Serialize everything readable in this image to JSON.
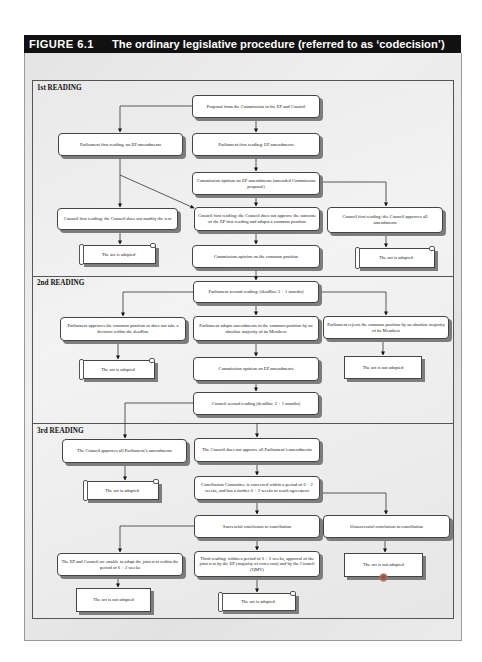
{
  "figure": {
    "number": "FIGURE 6.1",
    "title": "The ordinary legislative procedure (referred to as ‘codecision’)"
  },
  "sections": [
    {
      "label": "1st READING"
    },
    {
      "label": "2nd READING"
    },
    {
      "label": "3rd READING"
    }
  ],
  "first_reading": {
    "proposal": "Proposal from the Commission to the EP and Council",
    "parl_no_amend": "Parliament first reading: no EP amendments",
    "parl_amend": "Parliament first reading: EP amendments",
    "commission_opinion": "Commission opinion on EP amendments (amended Commission proposal)",
    "council_not_modify": "Council first reading: the Council does not modify the text",
    "council_not_approve": "Council first reading: the Council does not approve the outcome of the EP first reading and adopts a common position",
    "council_approves": "Council first reading: the Council approves all amendments",
    "act_adopted_left": "The act is adopted",
    "commission_opinion_common": "Commission opinion on the common position",
    "act_adopted_right": "The act is adopted"
  },
  "second_reading": {
    "parl_second": "Parliament second reading: (deadline 3 + 1 months)",
    "parl_approves": "Parliament approves the common position or does not take a decision within the deadline",
    "parl_adopts_amend": "Parliament adopts amendments to the common position by an absolute majority of its Members",
    "parl_rejects": "Parliament rejects the common position by an absolute majority of its Members",
    "act_adopted": "The act is adopted",
    "commission_opinion": "Commission opinion on EP amendments",
    "act_not_adopted": "The act is not adopted",
    "council_second": "Council second reading (deadline 3 + 1 months)"
  },
  "third_reading": {
    "council_approves": "The Council approves all Parliament’s amendments",
    "council_not_approve": "The Council does not approve all Parliament’s amendments",
    "act_adopted": "The act is adopted",
    "conciliation": "Conciliation Committee is convened within a period of 6 + 2 weeks, and has a further 6 + 2 weeks to reach agreement",
    "successful": "Successful conclusion to conciliation",
    "unsuccessful": "Unsuccessful conclusion to conciliation",
    "unable_adopt": "The EP and Council are unable to adopt the joint text within the period of 6 + 2 weeks",
    "third_reading_vote": "Third reading: within a period of 6 + 2 weeks, approval of the joint text by the EP (majority of votes cast) and by the Council (QMV)",
    "act_not_adopted_left": "The act is not adopted",
    "act_adopted_center": "The act is adopted",
    "act_not_adopted_right": "The act is not adopted"
  }
}
